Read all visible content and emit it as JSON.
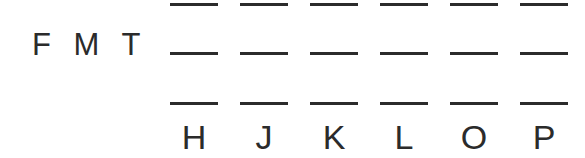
{
  "worksheet": {
    "row_label": "F M T",
    "background_color": "#ffffff",
    "ink_color": "#2b2b2b",
    "columns": [
      {
        "id": "col-h",
        "label": "H"
      },
      {
        "id": "col-j",
        "label": "J"
      },
      {
        "id": "col-k",
        "label": "K"
      },
      {
        "id": "col-l",
        "label": "L"
      },
      {
        "id": "col-o",
        "label": "O"
      },
      {
        "id": "col-p",
        "label": "P"
      }
    ],
    "blank_rows": [
      {
        "id": "blank-row-1",
        "values": [
          "",
          "",
          "",
          "",
          "",
          ""
        ]
      },
      {
        "id": "blank-row-2",
        "values": [
          "",
          "",
          "",
          "",
          "",
          ""
        ]
      },
      {
        "id": "blank-row-3",
        "values": [
          "",
          "",
          "",
          "",
          "",
          ""
        ]
      }
    ],
    "geometry": {
      "canvas_width": 585,
      "canvas_height": 158,
      "grid_left": 170,
      "column_pitch": 70,
      "blank_width": 48,
      "blank_thickness": 3,
      "row_tops": [
        3,
        52,
        102
      ],
      "label_row_top": 120
    }
  }
}
